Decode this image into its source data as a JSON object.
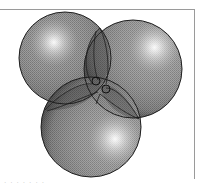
{
  "figure": {
    "caption": "· ·  · ·    · · ·",
    "colors": {
      "background": "#ffffff",
      "frame": "#9a9a9a",
      "sphere_fill": "#8c8c8c",
      "sphere_edge": "#1e1e1e",
      "highlight": "#ffffff"
    },
    "spheres": [
      {
        "name": "upper-left",
        "cx": 65,
        "cy": 58,
        "r": 46,
        "highlight_x": 53,
        "highlight_y": 42
      },
      {
        "name": "upper-right",
        "cx": 133,
        "cy": 69,
        "r": 49,
        "highlight_x": 155,
        "highlight_y": 45
      },
      {
        "name": "bottom",
        "cx": 91,
        "cy": 127,
        "r": 50,
        "highlight_x": 115,
        "highlight_y": 139
      }
    ]
  }
}
